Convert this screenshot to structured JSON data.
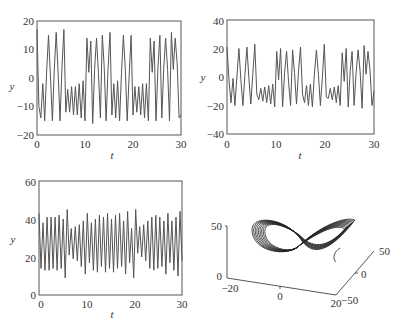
{
  "chart_data": [
    {
      "type": "line",
      "title": "",
      "xlabel": "t",
      "ylabel": "y",
      "xlim": [
        0,
        30
      ],
      "ylim": [
        -20,
        20
      ],
      "xticks": [
        "0",
        "10",
        "20",
        "30"
      ],
      "yticks": [
        "-20",
        "-10",
        "0",
        "10",
        "20"
      ],
      "grid": false,
      "frame": {
        "x0": 37,
        "y0": 21,
        "x1": 181,
        "y1": 135
      },
      "series": [
        {
          "name": "x(t)",
          "t": [
            0,
            0.3,
            0.6,
            0.9,
            1.2,
            1.5,
            1.8,
            2.1,
            2.4,
            2.7,
            3.0,
            3.3,
            3.6,
            3.9,
            4.2,
            4.5,
            4.8,
            5.1,
            5.4,
            5.7,
            6.0,
            6.3,
            6.6,
            6.9,
            7.2,
            7.5,
            7.8,
            8.1,
            8.4,
            8.7,
            9.0,
            9.3,
            9.6,
            9.9,
            10.2,
            10.5,
            10.8,
            11.1,
            11.4,
            11.7,
            12.0,
            12.3,
            12.6,
            12.9,
            13.2,
            13.5,
            13.8,
            14.1,
            14.4,
            14.7,
            15.0,
            15.3,
            15.6,
            15.9,
            16.2,
            16.5,
            16.8,
            17.1,
            17.4,
            17.7,
            18.0,
            18.3,
            18.6,
            18.9,
            19.2,
            19.5,
            19.8,
            20.1,
            20.4,
            20.7,
            21.0,
            21.3,
            21.6,
            21.9,
            22.2,
            22.5,
            22.8,
            23.1,
            23.4,
            23.7,
            24.0,
            24.3,
            24.6,
            24.9,
            25.2,
            25.5,
            25.8,
            26.1,
            26.4,
            26.7,
            27.0,
            27.3,
            27.6,
            27.9,
            28.2,
            28.5,
            28.8,
            29.1,
            29.4,
            29.7,
            30.0
          ],
          "values": [
            17,
            -10,
            -14,
            -2,
            -15,
            2,
            15,
            1,
            -15,
            3,
            16,
            2,
            -15,
            4,
            17,
            -12,
            -4,
            -12,
            -3,
            -13,
            -3,
            -13,
            -2,
            -14,
            -1,
            -15,
            14,
            2,
            13,
            -16,
            3,
            14,
            2,
            -14,
            15,
            4,
            -15,
            3,
            16,
            -13,
            -2,
            -14,
            -1,
            -15,
            2,
            15,
            3,
            -15,
            1,
            15,
            -13,
            -3,
            -12,
            -3,
            -13,
            -2,
            -14,
            -2,
            -15,
            14,
            2,
            13,
            -15,
            4,
            15,
            -14,
            3,
            14,
            3,
            -15,
            16,
            3,
            14,
            5,
            -14,
            -13
          ]
        }
      ]
    },
    {
      "type": "line",
      "title": "",
      "xlabel": "t",
      "ylabel": "y",
      "xlim": [
        0,
        30
      ],
      "ylim": [
        -40,
        40
      ],
      "xticks": [
        "0",
        "10",
        "20",
        "30"
      ],
      "yticks": [
        "-40",
        "-20",
        "0",
        "20",
        "40"
      ],
      "grid": false,
      "frame": {
        "x0": 227,
        "y0": 20,
        "x1": 374,
        "y1": 134
      },
      "series": [
        {
          "name": "y(t)",
          "values": [
            21,
            -2,
            -18,
            -1,
            -20,
            0,
            20,
            -2,
            -20,
            1,
            21,
            -1,
            -19,
            2,
            23,
            -12,
            -16,
            -8,
            -17,
            -7,
            -18,
            -6,
            -19,
            -5,
            -21,
            18,
            -2,
            20,
            -21,
            3,
            18,
            -4,
            -20,
            19,
            3,
            -19,
            4,
            21,
            -12,
            -18,
            -6,
            -20,
            -5,
            -21,
            2,
            19,
            2,
            -20,
            0,
            23,
            -14,
            -15,
            -8,
            -16,
            -7,
            -18,
            -6,
            -20,
            17,
            -3,
            20,
            -21,
            4,
            18,
            -20,
            3,
            19,
            4,
            -22,
            22,
            2,
            18,
            5,
            -20,
            -10
          ]
        }
      ]
    },
    {
      "type": "line",
      "title": "",
      "xlabel": "t",
      "ylabel": "y",
      "xlim": [
        0,
        30
      ],
      "ylim": [
        0,
        60
      ],
      "xticks": [
        "0",
        "10",
        "20",
        "30"
      ],
      "yticks": [
        "0",
        "20",
        "40",
        "60"
      ],
      "grid": false,
      "frame": {
        "x0": 39,
        "y0": 181,
        "x1": 182,
        "y1": 295
      },
      "series": [
        {
          "name": "z(t)",
          "values": [
            43,
            14,
            38,
            13,
            41,
            13,
            41,
            14,
            41,
            13,
            42,
            14,
            40,
            9,
            45,
            21,
            35,
            19,
            36,
            18,
            37,
            15,
            39,
            11,
            43,
            17,
            38,
            13,
            40,
            12,
            42,
            15,
            41,
            12,
            43,
            14,
            40,
            12,
            42,
            14,
            43,
            15,
            39,
            11,
            44,
            17,
            35,
            9,
            45,
            22,
            36,
            20,
            37,
            18,
            39,
            14,
            41,
            13,
            42,
            14,
            41,
            15,
            39,
            11,
            43,
            17,
            39,
            13,
            41,
            10,
            44,
            18
          ]
        }
      ]
    },
    {
      "type": "line",
      "subtype": "3d-attractor",
      "title": "",
      "xlim": [
        -20,
        20
      ],
      "ylim": [
        -50,
        50
      ],
      "zlim": [
        0,
        50
      ],
      "xticks": [
        "-20",
        "0",
        "20"
      ],
      "yticks": [
        "-50",
        "0",
        "50"
      ],
      "zticks": [
        "0",
        "50"
      ],
      "grid": false
    }
  ],
  "plots": {
    "tl": {
      "ylabel": "y",
      "xlabel": "t",
      "xt": [
        "0",
        "10",
        "20",
        "30"
      ],
      "yt": [
        "20",
        "10",
        "0",
        "−10",
        "−20"
      ]
    },
    "tr": {
      "ylabel": "y",
      "xlabel": "t",
      "xt": [
        "0",
        "10",
        "20",
        "30"
      ],
      "yt": [
        "40",
        "20",
        "0",
        "−20",
        "−40"
      ]
    },
    "bl": {
      "ylabel": "y",
      "xlabel": "t",
      "xt": [
        "0",
        "10",
        "20",
        "30"
      ],
      "yt": [
        "60",
        "40",
        "20",
        "0"
      ]
    },
    "br": {
      "zt": [
        "50",
        "0"
      ],
      "xt": [
        "−20",
        "0",
        "20"
      ],
      "yt": [
        "50",
        "0",
        "−50"
      ]
    }
  }
}
